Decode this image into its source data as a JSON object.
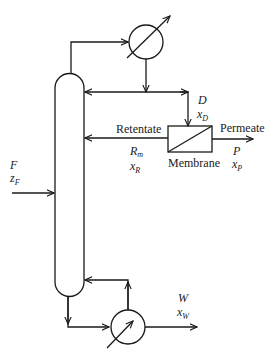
{
  "diagram": {
    "type": "distillation-membrane hybrid process flow",
    "units": {
      "column": {
        "label": "Distillation column"
      },
      "condenser": {
        "label": "Condenser"
      },
      "reboiler": {
        "label": "Reboiler"
      },
      "membrane": {
        "label": "Membrane"
      }
    },
    "streams": {
      "feed": {
        "symbol": "F",
        "composition_base": "z",
        "composition_sub": "F"
      },
      "distillate": {
        "symbol": "D",
        "composition_base": "x",
        "composition_sub": "D"
      },
      "retentate": {
        "label": "Retentate",
        "symbol_base": "R",
        "symbol_sub": "m",
        "composition_base": "x",
        "composition_sub": "R"
      },
      "permeate": {
        "label": "Permeate",
        "symbol": "P",
        "composition_base": "x",
        "composition_sub": "P"
      },
      "bottoms": {
        "symbol": "W",
        "composition_base": "x",
        "composition_sub": "W"
      }
    },
    "colors": {
      "line": "#1a1a1a",
      "background": "#ffffff"
    }
  }
}
